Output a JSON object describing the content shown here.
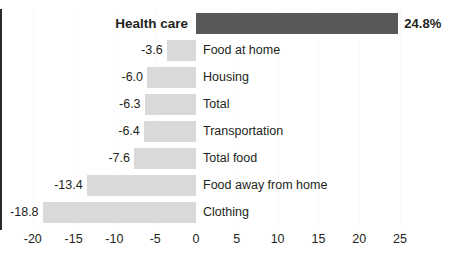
{
  "chart_data": {
    "type": "bar",
    "orientation": "horizontal",
    "title": "",
    "subtitle": "",
    "xlabel": "",
    "ylabel": "",
    "xlim": [
      -21.5,
      27.5
    ],
    "xticks": [
      -20,
      -15,
      -10,
      -5,
      0,
      5,
      10,
      15,
      20,
      25
    ],
    "xtick_labels": [
      "-20",
      "-15",
      "-10",
      "-5",
      "0",
      "5",
      "10",
      "15",
      "20",
      "25"
    ],
    "grid": "faint-vertical",
    "legend": "none",
    "categories": [
      "Health care",
      "Food at home",
      "Housing",
      "Total",
      "Transportation",
      "Total food",
      "Food away from home",
      "Clothing"
    ],
    "values": [
      24.8,
      -3.6,
      -6.0,
      -6.3,
      -6.4,
      -7.6,
      -13.4,
      -18.8
    ],
    "value_labels": [
      "24.8%",
      "-3.6",
      "-6.0",
      "-6.3",
      "-6.4",
      "-7.6",
      "-13.4",
      "-18.8"
    ],
    "highlight_category": "Health care",
    "colors": {
      "bar": "#d9d9d9",
      "highlight_bar": "#595959",
      "axis": "#2a2a2a",
      "text": "#231f20",
      "gridline": "#fafafa",
      "background": "#ffffff"
    }
  }
}
